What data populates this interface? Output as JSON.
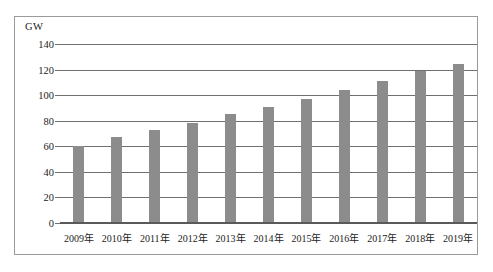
{
  "chart_data": {
    "type": "bar",
    "title": "",
    "subtitle": "",
    "unit_label": "GW",
    "xlabel": "",
    "ylabel": "GW",
    "ylim": [
      0,
      140
    ],
    "ytick_step": 20,
    "grid": true,
    "legend": false,
    "bar_color": "#8c8c8c",
    "categories": [
      "2009年",
      "2010年",
      "2011年",
      "2012年",
      "2013年",
      "2014年",
      "2015年",
      "2016年",
      "2017年",
      "2018年",
      "2019年"
    ],
    "values": [
      60,
      67,
      73,
      78,
      85,
      91,
      97,
      104,
      111,
      119,
      124
    ],
    "ytick_labels": [
      "0",
      "20",
      "40",
      "60",
      "80",
      "100",
      "120",
      "140"
    ],
    "yticks": [
      0,
      20,
      40,
      60,
      80,
      100,
      120,
      140
    ]
  }
}
